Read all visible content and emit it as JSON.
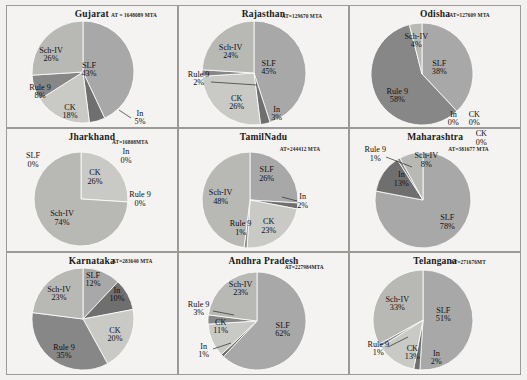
{
  "figure": {
    "type": "pie-grid",
    "rows": 3,
    "cols": 3,
    "slice_labels": [
      "SLF",
      "In",
      "CK",
      "Rule 9",
      "Sch-IV"
    ],
    "colors": {
      "SLF": "#a8a8a8",
      "In": "#6f6f6f",
      "CK": "#c9c9c6",
      "Rule 9": "#878787",
      "Sch-IV": "#b8b8b5",
      "panel_bg": "#f4f3f1",
      "border": "#9a9a96",
      "text": "#111111"
    }
  },
  "chart_data": [
    {
      "type": "pie",
      "title": "Gujarat",
      "annotation": "AT = 1648089 MTA",
      "categories": [
        "SLF",
        "In",
        "CK",
        "Rule 9",
        "Sch-IV"
      ],
      "values": [
        43,
        5,
        18,
        8,
        26
      ],
      "labels": [
        "SLF",
        "In",
        "CK",
        "Rule 9",
        "Sch-IV"
      ],
      "value_labels": [
        "43%",
        "5%",
        "18%",
        "8%",
        "26%"
      ]
    },
    {
      "type": "pie",
      "title": "Rajasthan",
      "annotation": "AT=129670 MTA",
      "categories": [
        "SLF",
        "In",
        "CK",
        "Rule 9",
        "Sch-IV"
      ],
      "values": [
        45,
        3,
        26,
        2,
        24
      ],
      "labels": [
        "SLF",
        "In",
        "CK",
        "Rule 9",
        "Sch-IV"
      ],
      "value_labels": [
        "45%",
        "3%",
        "26%",
        "2%",
        "24%"
      ]
    },
    {
      "type": "pie",
      "title": "Odisha",
      "annotation": "AT=127609 MTA",
      "categories": [
        "SLF",
        "In",
        "CK",
        "Rule 9",
        "Sch-IV"
      ],
      "values": [
        38,
        0,
        0,
        58,
        4
      ],
      "labels": [
        "SLF",
        "In",
        "CK",
        "Rule 9",
        "Sch-IV"
      ],
      "value_labels": [
        "38%",
        "0%",
        "0%",
        "58%",
        "4%"
      ]
    },
    {
      "type": "pie",
      "title": "Jharkhand",
      "annotation": "AT=16808MTA",
      "categories": [
        "SLF",
        "In",
        "CK",
        "Rule 9",
        "Sch-IV"
      ],
      "values": [
        0,
        0,
        26,
        0,
        74
      ],
      "labels": [
        "SLF",
        "In",
        "CK",
        "Rule 9",
        "Sch-IV"
      ],
      "value_labels": [
        "0%",
        "0%",
        "26%",
        "0%",
        "74%"
      ]
    },
    {
      "type": "pie",
      "title": "TamilNadu",
      "annotation": "AT=244412 MTA",
      "categories": [
        "SLF",
        "In",
        "CK",
        "Rule 9",
        "Sch-IV"
      ],
      "values": [
        26,
        2,
        23,
        1,
        48
      ],
      "labels": [
        "SLF",
        "In",
        "CK",
        "Rule 9",
        "Sch-IV"
      ],
      "value_labels": [
        "26%",
        "2%",
        "23%",
        "1%",
        "48%"
      ]
    },
    {
      "type": "pie",
      "title": "Maharashtra",
      "annotation": "AT=381677 MTA",
      "categories": [
        "SLF",
        "In",
        "CK",
        "Rule 9",
        "Sch-IV"
      ],
      "values": [
        78,
        13,
        0,
        1,
        8
      ],
      "labels": [
        "SLF",
        "In",
        "CK",
        "Rule 9",
        "Sch-IV"
      ],
      "value_labels": [
        "78%",
        "13%",
        "0%",
        "1%",
        "8%"
      ]
    },
    {
      "type": "pie",
      "title": "Karnataka",
      "annotation": "AT=283640 MTA",
      "categories": [
        "SLF",
        "In",
        "CK",
        "Rule 9",
        "Sch-IV"
      ],
      "values": [
        12,
        10,
        20,
        35,
        23
      ],
      "labels": [
        "SLF",
        "In",
        "CK",
        "Rule 9",
        "Sch-IV"
      ],
      "value_labels": [
        "12%",
        "10%",
        "20%",
        "35%",
        "23%"
      ]
    },
    {
      "type": "pie",
      "title": "Andhra Pradesh",
      "annotation": "AT=227984MTA",
      "categories": [
        "SLF",
        "In",
        "CK",
        "Rule 9",
        "Sch-IV"
      ],
      "values": [
        62,
        1,
        11,
        3,
        23
      ],
      "labels": [
        "SLF",
        "In",
        "CK",
        "Rule 9",
        "Sch-IV"
      ],
      "value_labels": [
        "62%",
        "1%",
        "11%",
        "3%",
        "23%"
      ]
    },
    {
      "type": "pie",
      "title": "Telangana",
      "annotation": "AT=271676MT",
      "categories": [
        "SLF",
        "In",
        "CK",
        "Rule 9",
        "Sch-IV"
      ],
      "values": [
        51,
        2,
        13,
        1,
        33
      ],
      "labels": [
        "SLF",
        "In",
        "CK",
        "Rule 9",
        "Sch-IV"
      ],
      "value_labels": [
        "51%",
        "2%",
        "13%",
        "1%",
        "33%"
      ]
    }
  ],
  "panels": [
    {
      "at_pos": {
        "left": 104,
        "top": 6
      },
      "pie": {
        "left": 24,
        "top": 14,
        "size": 104
      },
      "label_pos": [
        {
          "name": "SLF",
          "x": 82,
          "y": 64
        },
        {
          "name": "In",
          "x": 133,
          "y": 112
        },
        {
          "name": "CK",
          "x": 63,
          "y": 106
        },
        {
          "name": "Rule 9",
          "x": 33,
          "y": 86
        },
        {
          "name": "Sch-IV",
          "x": 44,
          "y": 49
        }
      ],
      "leaders": [
        [
          124,
          112,
          112,
          104
        ]
      ]
    },
    {
      "at_pos": {
        "left": 103,
        "top": 7
      },
      "pie": {
        "left": 22,
        "top": 14,
        "size": 106
      },
      "label_pos": [
        {
          "name": "SLF",
          "x": 90,
          "y": 62
        },
        {
          "name": "In",
          "x": 98,
          "y": 108
        },
        {
          "name": "CK",
          "x": 58,
          "y": 97
        },
        {
          "name": "Rule 9",
          "x": 20,
          "y": 73
        },
        {
          "name": "Sch-IV",
          "x": 52,
          "y": 46
        }
      ],
      "leaders": [
        [
          32,
          76,
          78,
          79
        ]
      ]
    },
    {
      "at_pos": {
        "left": 99,
        "top": 6
      },
      "pie": {
        "left": 20,
        "top": 16,
        "size": 104
      },
      "label_pos": [
        {
          "name": "SLF",
          "x": 89,
          "y": 62
        },
        {
          "name": "In",
          "x": 103,
          "y": 113
        },
        {
          "name": "CK",
          "x": 124,
          "y": 113
        },
        {
          "name": "Rule 9",
          "x": 47,
          "y": 90
        },
        {
          "name": "Sch-IV",
          "x": 66,
          "y": 35
        }
      ],
      "leaders": []
    },
    {
      "at_pos": {
        "left": 105,
        "top": 10
      },
      "pie": {
        "left": 26,
        "top": 22,
        "size": 96
      },
      "label_pos": [
        {
          "name": "SLF",
          "x": 26,
          "y": 31
        },
        {
          "name": "In",
          "x": 119,
          "y": 27
        },
        {
          "name": "CK",
          "x": 88,
          "y": 48
        },
        {
          "name": "Rule 9",
          "x": 133,
          "y": 70
        },
        {
          "name": "Sch-IV",
          "x": 55,
          "y": 89
        }
      ],
      "leaders": []
    },
    {
      "at_pos": {
        "left": 101,
        "top": 17
      },
      "pie": {
        "left": 22,
        "top": 22,
        "size": 98
      },
      "label_pos": [
        {
          "name": "SLF",
          "x": 88,
          "y": 45
        },
        {
          "name": "In",
          "x": 124,
          "y": 72
        },
        {
          "name": "CK",
          "x": 90,
          "y": 97
        },
        {
          "name": "Rule 9",
          "x": 62,
          "y": 99
        },
        {
          "name": "Sch-IV",
          "x": 42,
          "y": 68
        }
      ],
      "leaders": [
        [
          118,
          72,
          103,
          68
        ]
      ]
    },
    {
      "at_pos": {
        "left": 98,
        "top": 17
      },
      "pie": {
        "left": 24,
        "top": 22,
        "size": 98
      },
      "label_pos": [
        {
          "name": "SLF",
          "x": 97,
          "y": 93
        },
        {
          "name": "In",
          "x": 51,
          "y": 50
        },
        {
          "name": "CK",
          "x": 131,
          "y": 9
        },
        {
          "name": "Rule 9",
          "x": 25,
          "y": 25
        },
        {
          "name": "Sch-IV",
          "x": 76,
          "y": 31
        }
      ],
      "leaders": [
        [
          36,
          28,
          62,
          38
        ]
      ]
    },
    {
      "at_pos": {
        "left": 105,
        "top": 5
      },
      "pie": {
        "left": 24,
        "top": 14,
        "size": 104
      },
      "label_pos": [
        {
          "name": "SLF",
          "x": 86,
          "y": 27
        },
        {
          "name": "In",
          "x": 110,
          "y": 42
        },
        {
          "name": "CK",
          "x": 108,
          "y": 82
        },
        {
          "name": "Rule 9",
          "x": 57,
          "y": 99
        },
        {
          "name": "Sch-IV",
          "x": 52,
          "y": 41
        }
      ],
      "leaders": []
    },
    {
      "at_pos": {
        "left": 106,
        "top": 11
      },
      "pie": {
        "left": 28,
        "top": 18,
        "size": 100
      },
      "label_pos": [
        {
          "name": "SLF",
          "x": 104,
          "y": 77
        },
        {
          "name": "In",
          "x": 25,
          "y": 98
        },
        {
          "name": "CK",
          "x": 42,
          "y": 74
        },
        {
          "name": "Rule 9",
          "x": 20,
          "y": 56
        },
        {
          "name": "Sch-IV",
          "x": 62,
          "y": 36
        }
      ],
      "leaders": [
        [
          34,
          96,
          52,
          90
        ],
        [
          34,
          58,
          55,
          62
        ]
      ]
    },
    {
      "at_pos": {
        "left": 100,
        "top": 6
      },
      "pie": {
        "left": 22,
        "top": 16,
        "size": 102
      },
      "label_pos": [
        {
          "name": "SLF",
          "x": 93,
          "y": 62
        },
        {
          "name": "In",
          "x": 86,
          "y": 105
        },
        {
          "name": "CK",
          "x": 62,
          "y": 100
        },
        {
          "name": "Rule 9",
          "x": 28,
          "y": 96
        },
        {
          "name": "Sch-IV",
          "x": 47,
          "y": 51
        }
      ],
      "leaders": [
        [
          38,
          94,
          58,
          84
        ]
      ]
    }
  ]
}
